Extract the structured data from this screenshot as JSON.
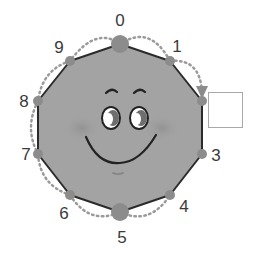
{
  "diagram": {
    "type": "decagon-counting-face",
    "colors": {
      "face_fill": "#a3a3a3",
      "outline": "#2b2b2b",
      "vertex_dot": "#8c8c8c",
      "dotted_arc": "#9a9a9a",
      "cheek": "#939393",
      "box_border": "#a8a8a8",
      "label_text": "#3a3a3a"
    },
    "vertices": [
      {
        "label": "0",
        "x": 120,
        "y": 44,
        "large": true,
        "lx": 120,
        "ly": 20
      },
      {
        "label": "1",
        "x": 170,
        "y": 61,
        "large": false,
        "lx": 177,
        "ly": 46
      },
      {
        "label": "2",
        "x": 202,
        "y": 101,
        "large": false,
        "lx": null,
        "ly": null
      },
      {
        "label": "3",
        "x": 202,
        "y": 154,
        "large": false,
        "lx": 216,
        "ly": 155
      },
      {
        "label": "4",
        "x": 170,
        "y": 195,
        "large": false,
        "lx": 184,
        "ly": 206
      },
      {
        "label": "5",
        "x": 120,
        "y": 212,
        "large": true,
        "lx": 122,
        "ly": 237
      },
      {
        "label": "6",
        "x": 70,
        "y": 195,
        "large": false,
        "lx": 64,
        "ly": 213
      },
      {
        "label": "7",
        "x": 38,
        "y": 154,
        "large": false,
        "lx": 26,
        "ly": 154
      },
      {
        "label": "8",
        "x": 38,
        "y": 101,
        "large": false,
        "lx": 24,
        "ly": 101
      },
      {
        "label": "9",
        "x": 70,
        "y": 61,
        "large": false,
        "lx": 59,
        "ly": 47
      }
    ],
    "answer_box": {
      "x": 208,
      "y": 92,
      "width": 35,
      "height": 36,
      "value": ""
    },
    "arrow_to_vertex": "2"
  }
}
